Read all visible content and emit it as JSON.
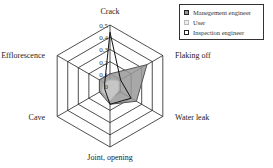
{
  "chart_data": {
    "type": "radar",
    "title": "",
    "categories": [
      "Crack",
      "Flaking off",
      "Water leak",
      "Joint, opening",
      "Cave",
      "Efflorescence"
    ],
    "rlim": [
      0,
      0.5
    ],
    "ticks": [
      "0",
      "0.1",
      "0.2",
      "0.3",
      "0.4",
      "0.5"
    ],
    "series": [
      {
        "name": "Manegement engineer",
        "values": [
          0.1,
          0.35,
          0.25,
          0.15,
          0.1,
          0.1
        ],
        "fill": "#999999",
        "stroke": "#555555"
      },
      {
        "name": "User",
        "values": [
          0.05,
          0.08,
          0.08,
          0.12,
          0.08,
          0.05
        ],
        "fill": "#cccccc",
        "stroke": "#bbbbbb"
      },
      {
        "name": "Inspection engineer",
        "values": [
          0.44,
          0.1,
          0.2,
          0.15,
          0.05,
          0.05
        ],
        "fill": "none",
        "stroke": "#111111"
      }
    ],
    "legend_position": "top-right"
  }
}
